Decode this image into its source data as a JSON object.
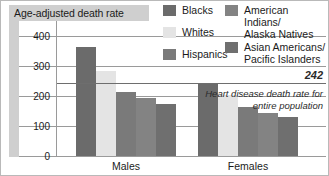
{
  "title": "Age-adjusted death rate",
  "group_labels": [
    "Males",
    "Females"
  ],
  "legend": [
    {
      "label": "Blacks",
      "color": "#6b6b6b"
    },
    {
      "label": "Whites",
      "color": "#e4e4e4"
    },
    {
      "label": "Hispanics",
      "color": "#7a7a7a"
    },
    {
      "label": "American Indians/\nAlaska Natives",
      "color": "#838383"
    },
    {
      "label": "Asian Americans/\nPacific Islanders",
      "color": "#6f6f6f"
    }
  ],
  "reference": {
    "value": "242",
    "note": "Heart disease death rate for entire population"
  },
  "axis": {
    "ticks": [
      "400",
      "300",
      "200",
      "100",
      "0"
    ]
  },
  "chart_data": {
    "type": "bar",
    "title": "Age-adjusted death rate",
    "xlabel": "",
    "ylabel": "Age-adjusted death rate",
    "ylim": [
      0,
      430
    ],
    "yticks": [
      0,
      100,
      200,
      300,
      400
    ],
    "grid": true,
    "legend_position": "top-right",
    "categories": [
      "Males",
      "Females"
    ],
    "series": [
      {
        "name": "Blacks",
        "color": "#6b6b6b",
        "values": [
          365,
          245
        ]
      },
      {
        "name": "Whites",
        "color": "#e4e4e4",
        "values": [
          283,
          203
        ]
      },
      {
        "name": "Hispanics",
        "color": "#7a7a7a",
        "values": [
          215,
          165
        ]
      },
      {
        "name": "American Indians/Alaska Natives",
        "color": "#838383",
        "values": [
          195,
          145
        ]
      },
      {
        "name": "Asian Americans/Pacific Islanders",
        "color": "#6f6f6f",
        "values": [
          175,
          130
        ]
      }
    ],
    "annotations": [
      {
        "type": "hline",
        "value": 242,
        "label": "242",
        "note": "Heart disease death rate for entire population"
      }
    ]
  }
}
